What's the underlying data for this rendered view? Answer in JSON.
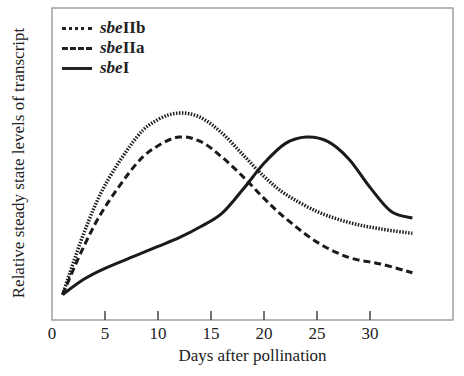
{
  "chart_data": {
    "type": "line",
    "title": "",
    "xlabel": "Days after pollination",
    "ylabel": "Relative steady state levels of transcript",
    "xlim": [
      0,
      38
    ],
    "xticks": [
      0,
      5,
      10,
      15,
      20,
      25,
      30
    ],
    "yticks": [],
    "grid": false,
    "legend_position": "upper left",
    "series": [
      {
        "name": "sbeIIb",
        "prefix": "sbe",
        "suffix": "IIb",
        "style": "dotted",
        "x": [
          1,
          3,
          5,
          8,
          10,
          12,
          14,
          16,
          18,
          20,
          22,
          25,
          28,
          31,
          34
        ],
        "y": [
          0.02,
          0.3,
          0.52,
          0.74,
          0.82,
          0.85,
          0.83,
          0.76,
          0.66,
          0.56,
          0.48,
          0.4,
          0.35,
          0.32,
          0.3
        ]
      },
      {
        "name": "sbeIIa",
        "prefix": "sbe",
        "suffix": "IIa",
        "style": "dashed",
        "x": [
          1,
          3,
          5,
          8,
          10,
          12,
          14,
          16,
          18,
          20,
          22,
          25,
          28,
          31,
          34
        ],
        "y": [
          0.02,
          0.24,
          0.42,
          0.62,
          0.7,
          0.74,
          0.72,
          0.65,
          0.56,
          0.46,
          0.37,
          0.26,
          0.19,
          0.16,
          0.12
        ]
      },
      {
        "name": "sbeI",
        "prefix": "sbe",
        "suffix": "I",
        "style": "solid",
        "x": [
          1,
          3,
          5,
          8,
          10,
          12,
          14,
          16,
          18,
          20,
          22,
          24,
          26,
          28,
          30,
          32,
          34
        ],
        "y": [
          0.02,
          0.09,
          0.14,
          0.2,
          0.24,
          0.28,
          0.33,
          0.39,
          0.5,
          0.62,
          0.71,
          0.74,
          0.72,
          0.64,
          0.51,
          0.4,
          0.37
        ]
      }
    ]
  },
  "legend": [
    {
      "prefix": "sbe",
      "suffix": "IIb"
    },
    {
      "prefix": "sbe",
      "suffix": "IIa"
    },
    {
      "prefix": "sbe",
      "suffix": "I"
    }
  ],
  "axis": {
    "xlabel": "Days after pollination",
    "ylabel": "Relative steady state levels of transcript"
  }
}
